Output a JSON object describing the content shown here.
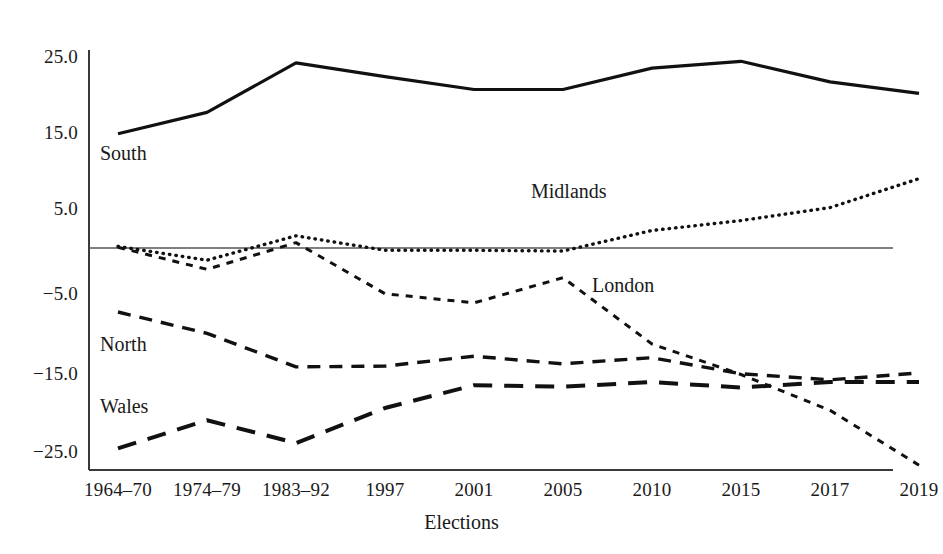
{
  "chart_data": {
    "type": "line",
    "title": "",
    "xlabel": "Elections",
    "ylabel": "",
    "categories": [
      "1964–70",
      "1974–79",
      "1983–92",
      "1997",
      "2001",
      "2005",
      "2010",
      "2015",
      "2017",
      "2019"
    ],
    "yticks": [
      "25.0",
      "15.0",
      "5.0",
      "−5.0",
      "−15.0",
      "−25.0"
    ],
    "ytick_values": [
      25.0,
      15.0,
      5.0,
      -5.0,
      -15.0,
      -25.0
    ],
    "ylim": [
      -29.5,
      27.5
    ],
    "grid": false,
    "zero_line": true,
    "legend": "inline-labels",
    "series": [
      {
        "name": "South",
        "style": "solid",
        "label_x_index": 0,
        "values": [
          15.0,
          17.8,
          24.3,
          22.5,
          20.8,
          20.8,
          23.6,
          24.5,
          21.8,
          20.3
        ]
      },
      {
        "name": "Midlands",
        "style": "dotted",
        "label_x_index": 5,
        "values": [
          0.2,
          -1.6,
          1.6,
          -0.3,
          -0.3,
          -0.4,
          2.3,
          3.6,
          5.3,
          9.1
        ]
      },
      {
        "name": "London",
        "style": "short-dash",
        "label_x_index": 6,
        "values": [
          0.1,
          -2.8,
          0.7,
          -6.0,
          -7.2,
          -3.9,
          -12.6,
          -16.6,
          -21.3,
          -28.5
        ]
      },
      {
        "name": "North",
        "style": "medium-dash",
        "label_x_index": 0,
        "values": [
          -8.4,
          -11.2,
          -15.6,
          -15.5,
          -14.2,
          -15.2,
          -14.4,
          -16.5,
          -17.3,
          -16.4
        ]
      },
      {
        "name": "Wales",
        "style": "long-dash",
        "label_x_index": 0,
        "values": [
          -26.3,
          -22.6,
          -25.6,
          -21.0,
          -18.0,
          -18.2,
          -17.6,
          -18.3,
          -17.6,
          -17.6
        ]
      }
    ]
  },
  "axis": {
    "x_title": "Elections"
  }
}
